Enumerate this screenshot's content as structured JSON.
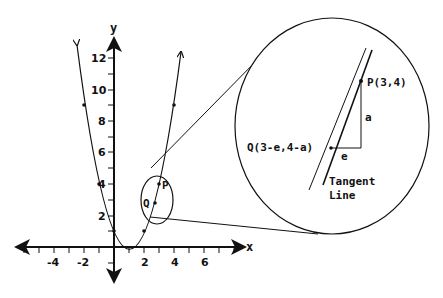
{
  "diagram": {
    "type": "tangent-line-zoom",
    "function": "y = (x-1)^2",
    "axes": {
      "x_label": "x",
      "y_label": "y",
      "x_ticks": [
        "-4",
        "-2",
        "2",
        "4",
        "6"
      ],
      "y_ticks": [
        "2",
        "4",
        "6",
        "8",
        "10",
        "12"
      ]
    },
    "points": {
      "p_small": "P",
      "q_small": "Q"
    },
    "zoom_view": {
      "p_label": "P(3,4)",
      "q_label": "Q(3-e,4-a)",
      "rise_label": "a",
      "run_label": "e",
      "tangent_label_line1": "Tangent",
      "tangent_label_line2": "Line"
    },
    "colors": {
      "ink": "#111111",
      "background": "#ffffff"
    }
  }
}
